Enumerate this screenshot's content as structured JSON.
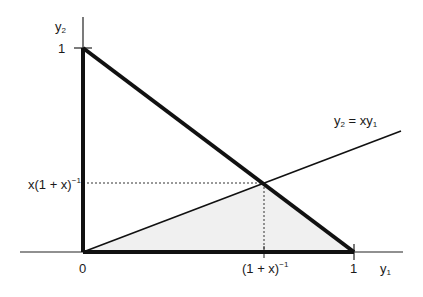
{
  "diagram": {
    "type": "geometric-region",
    "axes": {
      "x_label": "y",
      "x_label_sub": "1",
      "y_label": "y",
      "y_label_sub": "2",
      "origin_label": "0",
      "x_tick_one": "1",
      "y_tick_one": "1"
    },
    "line_label": {
      "lhs": "y",
      "lhs_sub": "2",
      "eq": " = xy",
      "rhs_sub": "1"
    },
    "intersection": {
      "x_label_base": "(1 + x)",
      "x_label_sup": "−1",
      "y_label_base": "x(1 + x)",
      "y_label_sup": "−1"
    },
    "colors": {
      "stroke": "#111111",
      "shade": "#f0f0f0",
      "guide": "#333333"
    }
  }
}
